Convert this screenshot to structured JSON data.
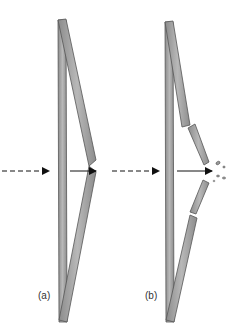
{
  "diagram": {
    "panels": [
      {
        "id": "a",
        "label": "(a)",
        "description": "Intact beam with bent/kinked strut under load, arrow passes through"
      },
      {
        "id": "b",
        "label": "(b)",
        "description": "Fractured bent strut with debris fragments at the break point"
      }
    ],
    "colors": {
      "strut_fill": "#a6a6a6",
      "strut_stroke": "#555555",
      "arrow": "#111111",
      "debris": "#777777",
      "background": "#ffffff"
    },
    "arrows": {
      "incoming_style": "dashed",
      "outgoing_style": "solid"
    }
  }
}
